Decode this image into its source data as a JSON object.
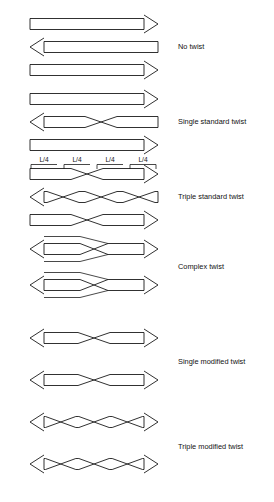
{
  "figure": {
    "width": 274,
    "height": 502,
    "line_color": "#1a1a1a",
    "background": "#ffffff"
  },
  "segment_labels": {
    "quarter": "L/4",
    "positions_x": [
      44,
      77,
      110,
      143
    ],
    "label_y": 162,
    "tick_row_y": 171
  },
  "groups": [
    {
      "id": "no-twist",
      "label": "No twist",
      "label_x": 178,
      "label_y": 47,
      "rows": [
        {
          "y": 24,
          "dir": "right",
          "crossings": 0
        },
        {
          "y": 47,
          "dir": "left",
          "crossings": 0
        },
        {
          "y": 70,
          "dir": "right",
          "crossings": 0
        }
      ]
    },
    {
      "id": "single-standard-twist",
      "label": "Single standard twist",
      "label_x": 178,
      "label_y": 122,
      "rows": [
        {
          "y": 99,
          "dir": "right",
          "crossings": 0
        },
        {
          "y": 122,
          "dir": "left",
          "crossings": 1
        },
        {
          "y": 145,
          "dir": "right",
          "crossings": 0
        }
      ]
    },
    {
      "id": "triple-standard-twist",
      "label": "Triple standard twist",
      "label_x": 178,
      "label_y": 197,
      "rows": [
        {
          "y": 174,
          "dir": "right",
          "crossings": 1
        },
        {
          "y": 197,
          "dir": "left",
          "crossings": 3
        },
        {
          "y": 220,
          "dir": "right",
          "crossings": 1
        }
      ]
    },
    {
      "id": "complex-twist",
      "label": "Complex twist",
      "label_x": 178,
      "label_y": 267,
      "rows": [
        {
          "y": 249,
          "dir": "left",
          "crossings": 1
        },
        {
          "y": 285,
          "dir": "left",
          "crossings": 1
        }
      ]
    },
    {
      "id": "single-modified-twist",
      "label": "Single modified twist",
      "label_x": 178,
      "label_y": 362,
      "rows": [
        {
          "y": 338,
          "dir": "both",
          "crossings": 1
        },
        {
          "y": 380,
          "dir": "both",
          "crossings": 1
        }
      ]
    },
    {
      "id": "triple-modified-twist",
      "label": "Triple modified twist",
      "label_x": 178,
      "label_y": 447,
      "rows": [
        {
          "y": 422,
          "dir": "both",
          "crossings": 3
        },
        {
          "y": 464,
          "dir": "both",
          "crossings": 3
        }
      ]
    }
  ],
  "geometry": {
    "bar_left": 30,
    "bar_right": 158,
    "bar_half_height": 5.5,
    "arrow_len": 14,
    "arrow_half": 9
  }
}
